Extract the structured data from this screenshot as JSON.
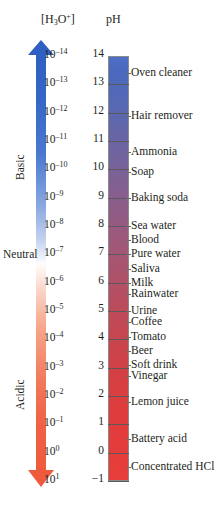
{
  "figure": {
    "headers": {
      "concentration_label_html": "[H3O+]",
      "concentration_prefix": "[H",
      "concentration_sub": "3",
      "concentration_mid": "O",
      "concentration_sup": "+",
      "concentration_suffix": "]",
      "ph_label": "pH"
    },
    "regions": [
      {
        "name": "basic",
        "label": "Basic",
        "color": "#2f5fc0"
      },
      {
        "name": "neutral",
        "label": "Neutral",
        "color": "#231f20"
      },
      {
        "name": "acidic",
        "label": "Acidic",
        "color": "#ee5a3c"
      }
    ],
    "arrows": {
      "basic_direction": "up",
      "basic_color": "#2f5fc0",
      "acidic_direction": "down",
      "acidic_color": "#ee5a3c"
    },
    "bar": {
      "top_color": "#4f6fc4",
      "mid_color": "#b05168",
      "bottom_color": "#e83e3b"
    }
  },
  "chart_data": {
    "type": "bar",
    "xlabel": "",
    "ylabel": "pH",
    "ylim": [
      -1,
      14
    ],
    "grid": false,
    "legend": "none",
    "axes": [
      {
        "name": "concentration",
        "label": "[H3O+]",
        "unit": "M"
      },
      {
        "name": "ph",
        "label": "pH",
        "unit": ""
      }
    ],
    "categories": [
      14,
      13,
      12,
      11,
      10,
      9,
      8,
      7,
      6,
      5,
      4,
      3,
      2,
      1,
      0,
      -1
    ],
    "rows": [
      {
        "ph": "14",
        "ph_value": 14,
        "exponent": "-14",
        "concentration": "10",
        "substances": [
          "Oven cleaner"
        ]
      },
      {
        "ph": "13",
        "ph_value": 13,
        "exponent": "-13",
        "concentration": "10",
        "substances": []
      },
      {
        "ph": "12",
        "ph_value": 12,
        "exponent": "-12",
        "concentration": "10",
        "substances": [
          "Hair remover"
        ]
      },
      {
        "ph": "11",
        "ph_value": 11,
        "exponent": "-11",
        "concentration": "10",
        "substances": [
          "Ammonia"
        ]
      },
      {
        "ph": "10",
        "ph_value": 10,
        "exponent": "-10",
        "concentration": "10",
        "substances": [
          "Soap"
        ]
      },
      {
        "ph": "9",
        "ph_value": 9,
        "exponent": "-9",
        "concentration": "10",
        "substances": [
          "Baking soda"
        ]
      },
      {
        "ph": "8",
        "ph_value": 8,
        "exponent": "-8",
        "concentration": "10",
        "substances": [
          "Sea water",
          "Blood"
        ]
      },
      {
        "ph": "7",
        "ph_value": 7,
        "exponent": "-7",
        "concentration": "10",
        "substances": [
          "Pure water",
          "Saliva"
        ]
      },
      {
        "ph": "6",
        "ph_value": 6,
        "exponent": "-6",
        "concentration": "10",
        "substances": [
          "Milk",
          "Rainwater"
        ]
      },
      {
        "ph": "5",
        "ph_value": 5,
        "exponent": "-5",
        "concentration": "10",
        "substances": [
          "Urine",
          "Coffee"
        ]
      },
      {
        "ph": "4",
        "ph_value": 4,
        "exponent": "-4",
        "concentration": "10",
        "substances": [
          "Tomato"
        ]
      },
      {
        "ph": "3",
        "ph_value": 3,
        "exponent": "-3",
        "concentration": "10",
        "substances": [
          "Beer",
          "Soft drink"
        ]
      },
      {
        "ph": "2",
        "ph_value": 2,
        "exponent": "-2",
        "concentration": "10",
        "substances": [
          "Vinegar"
        ]
      },
      {
        "ph": "1",
        "ph_value": 1,
        "exponent": "-1",
        "concentration": "10",
        "substances": [
          "Lemon juice"
        ]
      },
      {
        "ph": "0",
        "ph_value": 0,
        "exponent": "0",
        "concentration": "10",
        "substances": [
          "Battery acid"
        ]
      },
      {
        "ph": "−1",
        "ph_value": -1,
        "exponent": "1",
        "concentration": "10",
        "substances": [
          "Concentrated HCl"
        ]
      }
    ],
    "substance_positions": [
      {
        "label": "Oven cleaner",
        "ph": 13.4
      },
      {
        "label": "Hair remover",
        "ph": 11.9
      },
      {
        "label": "Ammonia",
        "ph": 10.6
      },
      {
        "label": "Soap",
        "ph": 9.9
      },
      {
        "label": "Baking soda",
        "ph": 9.0
      },
      {
        "label": "Sea water",
        "ph": 8.0
      },
      {
        "label": "Blood",
        "ph": 7.5
      },
      {
        "label": "Pure water",
        "ph": 7.0
      },
      {
        "label": "Saliva",
        "ph": 6.5
      },
      {
        "label": "Milk",
        "ph": 6.0
      },
      {
        "label": "Rainwater",
        "ph": 5.6
      },
      {
        "label": "Urine",
        "ph": 5.0
      },
      {
        "label": "Coffee",
        "ph": 4.6
      },
      {
        "label": "Tomato",
        "ph": 4.1
      },
      {
        "label": "Beer",
        "ph": 3.6
      },
      {
        "label": "Soft drink",
        "ph": 3.1
      },
      {
        "label": "Vinegar",
        "ph": 2.7
      },
      {
        "label": "Lemon juice",
        "ph": 1.8
      },
      {
        "label": "Battery acid",
        "ph": 0.5
      },
      {
        "label": "Concentrated HCl",
        "ph": -0.5
      }
    ]
  }
}
